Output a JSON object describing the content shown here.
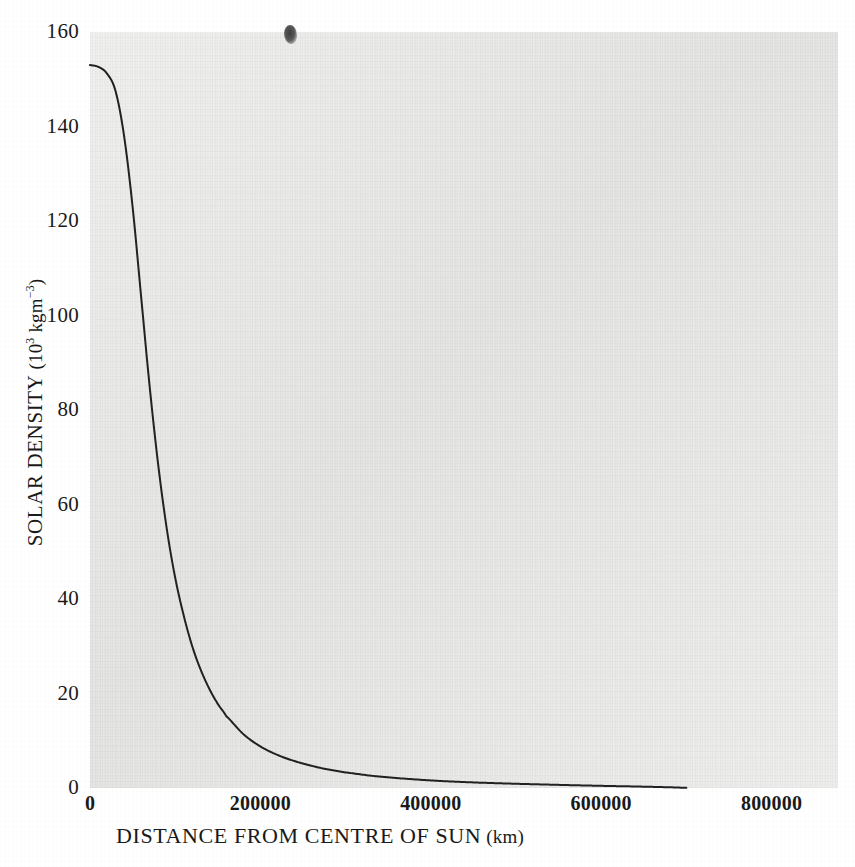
{
  "chart_data": {
    "type": "line",
    "title": "",
    "subtitle": "",
    "xlabel": "DISTANCE FROM CENTRE OF SUN",
    "xunit": "(km)",
    "ylabel": "SOLAR DENSITY",
    "yunit_mantissa": "(10",
    "yunit_exp1": "3",
    "yunit_mid": " kgm",
    "yunit_exp2": "−3",
    "yunit_close": ")",
    "ylabel_plain": "SOLAR DENSITY (10^3 kgm^-3)",
    "xlim": [
      0,
      878000
    ],
    "ylim": [
      0,
      160
    ],
    "xticks": [
      0,
      200000,
      400000,
      600000,
      800000
    ],
    "xtick_labels": [
      "0",
      "200000",
      "400000",
      "600000",
      "800000"
    ],
    "yticks": [
      0,
      20,
      40,
      60,
      80,
      100,
      120,
      140,
      160
    ],
    "ytick_labels": [
      "0",
      "20",
      "40",
      "60",
      "80",
      "100",
      "120",
      "140",
      "160"
    ],
    "grid": false,
    "legend": null,
    "legend_position": "none",
    "line_color": "#222222",
    "line_width": 2.0,
    "panel_color": "#e9e9e7",
    "page_color": "#ffffff",
    "series": [
      {
        "name": "Solar density profile",
        "x": [
          0,
          10000,
          20000,
          30000,
          40000,
          50000,
          60000,
          70000,
          80000,
          90000,
          100000,
          110000,
          120000,
          130000,
          140000,
          150000,
          160000,
          180000,
          200000,
          220000,
          240000,
          260000,
          280000,
          300000,
          330000,
          360000,
          400000,
          440000,
          480000,
          520000,
          560000,
          600000,
          640000,
          680000,
          700000
        ],
        "y": [
          153.0,
          152.6,
          151.2,
          147.5,
          138.0,
          123.0,
          104.0,
          85.0,
          68.5,
          55.0,
          44.5,
          36.5,
          30.0,
          25.0,
          21.0,
          17.8,
          15.2,
          11.4,
          8.8,
          7.0,
          5.7,
          4.7,
          3.9,
          3.3,
          2.6,
          2.1,
          1.6,
          1.25,
          1.0,
          0.8,
          0.62,
          0.46,
          0.32,
          0.16,
          0.05
        ]
      }
    ],
    "annotations": [
      {
        "name": "ink-smudge",
        "kind": "scan-artifact",
        "x_px": 290,
        "y_px": 34
      }
    ]
  },
  "axes": {
    "x_tick_px": [
      98,
      264,
      430,
      596,
      762
    ],
    "y_tick_px": [
      788,
      693.5,
      599,
      504.5,
      410,
      315.5,
      221,
      126.5,
      32
    ]
  }
}
